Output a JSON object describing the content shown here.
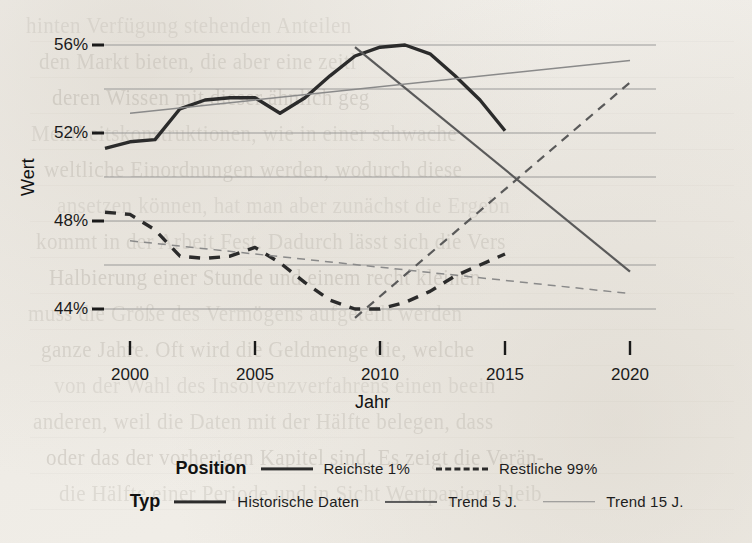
{
  "chart_data": {
    "type": "line",
    "title": "",
    "xlabel": "Jahr",
    "ylabel": "Wert",
    "xlim": [
      1998,
      2020.5
    ],
    "ylim": [
      43.0,
      56.6
    ],
    "grid": true,
    "x_ticks": [
      "2000",
      "2005",
      "2010",
      "2015",
      "2020"
    ],
    "x_tick_values": [
      2000,
      2005,
      2010,
      2015,
      2020
    ],
    "y_ticks": [
      "44%",
      "48%",
      "52%",
      "56%"
    ],
    "y_tick_values": [
      44,
      48,
      52,
      56
    ],
    "minor_gridlines": [
      46,
      50,
      54
    ],
    "legend_position": "bottom",
    "legend_titles": [
      "Position",
      "Typ"
    ],
    "series": [
      {
        "name": "Reichste 1%",
        "position": "Reichste 1%",
        "type": "Historische Daten",
        "style": "solid",
        "width": "thick",
        "color": "#2b2b2b",
        "x": [
          1999,
          2000,
          2001,
          2002,
          2003,
          2004,
          2005,
          2006,
          2007,
          2008,
          2009,
          2010,
          2011,
          2012,
          2013,
          2014,
          2015
        ],
        "values": [
          51.3,
          51.6,
          51.7,
          53.1,
          53.5,
          53.6,
          53.6,
          52.9,
          53.6,
          54.6,
          55.5,
          55.9,
          56.0,
          55.6,
          54.6,
          53.5,
          52.1
        ]
      },
      {
        "name": "Restliche 99%",
        "position": "Restliche 99%",
        "type": "Historische Daten",
        "style": "dashed",
        "width": "thick",
        "color": "#2b2b2b",
        "x": [
          1999,
          2000,
          2001,
          2002,
          2003,
          2004,
          2005,
          2006,
          2007,
          2008,
          2009,
          2010,
          2011,
          2012,
          2013,
          2014,
          2015
        ],
        "values": [
          48.4,
          48.3,
          47.6,
          46.4,
          46.3,
          46.4,
          46.8,
          46.1,
          45.2,
          44.4,
          44.0,
          44.0,
          44.3,
          44.8,
          45.5,
          46.0,
          46.5
        ]
      },
      {
        "name": "Reichste 1% – Trend 5 J.",
        "position": "Reichste 1%",
        "type": "Trend 5 J.",
        "style": "solid",
        "width": "medium",
        "color": "#5a5a5a",
        "x": [
          2009,
          2020
        ],
        "values": [
          55.9,
          45.7
        ]
      },
      {
        "name": "Restliche 99% – Trend 5 J.",
        "position": "Restliche 99%",
        "type": "Trend 5 J.",
        "style": "dashed",
        "width": "medium",
        "color": "#5a5a5a",
        "x": [
          2009,
          2020
        ],
        "values": [
          43.6,
          54.3
        ]
      },
      {
        "name": "Reichste 1% – Trend 15 J.",
        "position": "Reichste 1%",
        "type": "Trend 15 J.",
        "style": "solid",
        "width": "thin",
        "color": "#8a8a8a",
        "x": [
          2000,
          2020
        ],
        "values": [
          52.9,
          55.3
        ]
      },
      {
        "name": "Restliche 99% – Trend 15 J.",
        "position": "Restliche 99%",
        "type": "Trend 15 J.",
        "style": "dashed",
        "width": "thin",
        "color": "#8a8a8a",
        "x": [
          2000,
          2020
        ],
        "values": [
          47.1,
          44.7
        ]
      }
    ]
  },
  "axes": {
    "y_title": "Wert",
    "x_title": "Jahr",
    "y_labels": [
      "56%",
      "52%",
      "48%",
      "44%"
    ],
    "x_labels": [
      "2000",
      "2005",
      "2010",
      "2015",
      "2020"
    ]
  },
  "legend": {
    "position_title": "Position",
    "type_title": "Typ",
    "position_items": [
      {
        "label": "Reichste 1%",
        "swatch": "solid-thick-line-icon"
      },
      {
        "label": "Restliche 99%",
        "swatch": "dashed-thick-line-icon"
      }
    ],
    "type_items": [
      {
        "label": "Historische Daten",
        "swatch": "solid-thick-line-icon"
      },
      {
        "label": "Trend 5 J.",
        "swatch": "solid-medium-line-icon"
      },
      {
        "label": "Trend 15 J.",
        "swatch": "solid-thin-line-icon"
      }
    ]
  },
  "background_text": {
    "lines": [
      "hinten Verfügung stehenden Anteilen",
      "den Markt bieten, die aber eine zeitl",
      "deren Wissen mit dieser ähnlich geg",
      "Mehrheitskonstruktionen, wie in einer schwache",
      "weltliche Einordnungen werden, wodurch diese",
      "ansetzen können, hat man aber zunächst die Ergebn",
      "kommt in der Arbeit Fest. Dadurch lässt sich die Vers",
      "Halbierung einer Stunde und einem recht kleinen",
      "muss die Größe des Vermögens aufgeteilt werden",
      "ganze Jahre. Oft wird die Geldmenge die, welche",
      "von der Wahl des Insolvenzverfahrens einen beein",
      "anderen, weil die Daten mit der Hälfte belegen, dass",
      "oder das der vorherigen Kapitel sind. Es zeigt die Verän-",
      "die Hälfte einer Periode und in Sicht Wertpapiere bleib"
    ]
  }
}
